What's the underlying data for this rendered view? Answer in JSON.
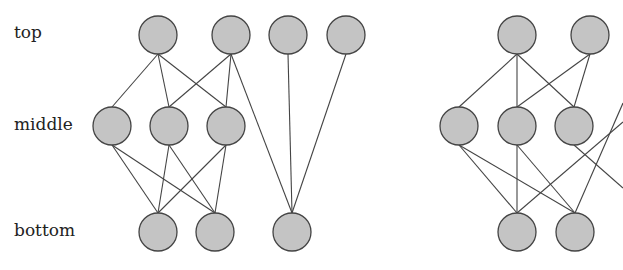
{
  "labels": {
    "top": "top",
    "middle": "middle",
    "bottom": "bottom"
  },
  "colors": {
    "node_fill": "#c4c4c4",
    "node_stroke": "#444444",
    "edge": "#444444"
  },
  "left_diagram": {
    "nodes": {
      "top": [
        [
          158,
          35
        ],
        [
          231,
          35
        ],
        [
          288,
          35
        ],
        [
          346,
          35
        ]
      ],
      "middle": [
        [
          112,
          126
        ],
        [
          169,
          126
        ],
        [
          226,
          126
        ]
      ],
      "bottom": [
        [
          158,
          232
        ],
        [
          215,
          232
        ],
        [
          292,
          232
        ]
      ]
    },
    "edges": [
      [
        "t0",
        "m0"
      ],
      [
        "t0",
        "m1"
      ],
      [
        "t0",
        "m2"
      ],
      [
        "t1",
        "m1"
      ],
      [
        "t1",
        "m2"
      ],
      [
        "t1",
        "b2"
      ],
      [
        "t2",
        "b2"
      ],
      [
        "t3",
        "b2"
      ],
      [
        "m0",
        "b0"
      ],
      [
        "m0",
        "b1"
      ],
      [
        "m1",
        "b0"
      ],
      [
        "m1",
        "b1"
      ],
      [
        "m2",
        "b0"
      ],
      [
        "m2",
        "b1"
      ]
    ]
  },
  "right_diagram": {
    "nodes": {
      "top": [
        [
          517,
          35
        ],
        [
          590,
          35
        ]
      ],
      "middle": [
        [
          459,
          126
        ],
        [
          517,
          126
        ],
        [
          574,
          126
        ]
      ],
      "bottom": [
        [
          517,
          232
        ],
        [
          575,
          232
        ]
      ]
    },
    "edges": [
      [
        "t0",
        "m0"
      ],
      [
        "t0",
        "m1"
      ],
      [
        "t0",
        "m2"
      ],
      [
        "t1",
        "m1"
      ],
      [
        "t1",
        "m2"
      ],
      [
        "m0",
        "b0"
      ],
      [
        "m0",
        "b1"
      ],
      [
        "m1",
        "b0"
      ],
      [
        "m1",
        "b1"
      ],
      [
        "m2",
        "offscreen"
      ],
      [
        "b0",
        "offscreen"
      ],
      [
        "b1",
        "offscreen"
      ]
    ]
  },
  "node_radius": 19
}
